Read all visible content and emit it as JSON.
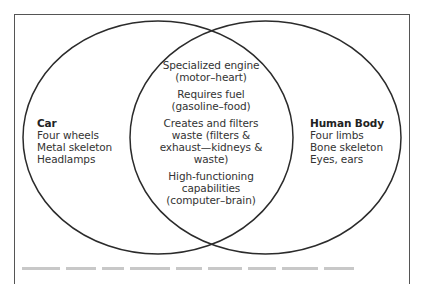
{
  "diagram": {
    "type": "venn",
    "sets": [
      {
        "id": "left",
        "title": "Car",
        "items": [
          "Four wheels",
          "Metal skeleton",
          "Headlamps"
        ]
      },
      {
        "id": "right",
        "title": "Human Body",
        "items": [
          "Four limbs",
          "Bone skeleton",
          "Eyes, ears"
        ]
      }
    ],
    "intersection": {
      "items": [
        {
          "line1": "Specialized engine",
          "line2": "(motor–heart)"
        },
        {
          "line1": "Requires fuel",
          "line2": "(gasoline–food)"
        },
        {
          "line1": "Creates and filters",
          "line2": "waste (filters &",
          "line3": "exhaust—kidneys &",
          "line4": "waste)"
        },
        {
          "line1": "High-functioning",
          "line2": "capabilities",
          "line3": "(computer–brain)"
        }
      ]
    },
    "colors": {
      "stroke": "#2b2b2b",
      "frame": "#555555",
      "text": "#333333",
      "background": "#ffffff"
    }
  }
}
